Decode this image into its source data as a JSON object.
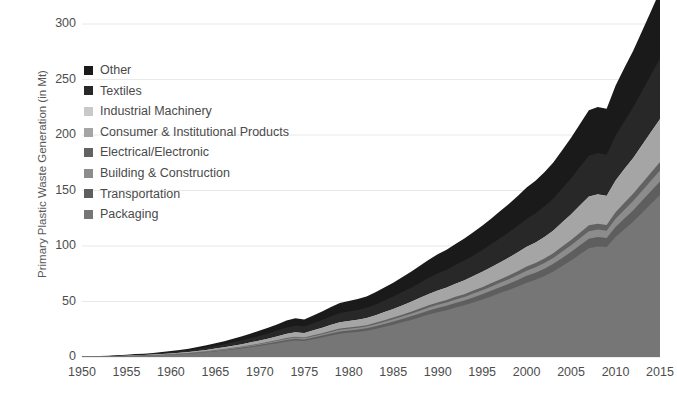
{
  "chart_data": {
    "type": "area",
    "stacked": true,
    "title": "",
    "xlabel": "",
    "ylabel": "Primary Plastic Waste Generation (in Mt)",
    "xlim": [
      1950,
      2015
    ],
    "ylim": [
      0,
      300
    ],
    "ytick_values": [
      0,
      50,
      100,
      150,
      200,
      250,
      300
    ],
    "ytick_labels": [
      "0",
      "50",
      "100",
      "150",
      "200",
      "250",
      "300"
    ],
    "xtick_values": [
      1950,
      1955,
      1960,
      1965,
      1970,
      1975,
      1980,
      1985,
      1990,
      1995,
      2000,
      2005,
      2010,
      2015
    ],
    "xtick_labels": [
      "1950",
      "1955",
      "1960",
      "1965",
      "1970",
      "1975",
      "1980",
      "1985",
      "1990",
      "1995",
      "2000",
      "2005",
      "2010",
      "2015"
    ],
    "grid": "horizontal",
    "legend_position": "upper-left-inside",
    "x": [
      1950,
      1951,
      1952,
      1953,
      1954,
      1955,
      1956,
      1957,
      1958,
      1959,
      1960,
      1961,
      1962,
      1963,
      1964,
      1965,
      1966,
      1967,
      1968,
      1969,
      1970,
      1971,
      1972,
      1973,
      1974,
      1975,
      1976,
      1977,
      1978,
      1979,
      1980,
      1981,
      1982,
      1983,
      1984,
      1985,
      1986,
      1987,
      1988,
      1989,
      1990,
      1991,
      1992,
      1993,
      1994,
      1995,
      1996,
      1997,
      1998,
      1999,
      2000,
      2001,
      2002,
      2003,
      2004,
      2005,
      2006,
      2007,
      2008,
      2009,
      2010,
      2011,
      2012,
      2013,
      2014,
      2015
    ],
    "series": [
      {
        "name": "Packaging",
        "color": "#767676",
        "values": [
          0.2,
          0.3,
          0.4,
          0.5,
          0.6,
          0.8,
          1.0,
          1.2,
          1.4,
          1.7,
          2.1,
          2.5,
          3.0,
          3.6,
          4.3,
          5.0,
          5.8,
          6.7,
          7.7,
          8.8,
          10.0,
          11.2,
          12.5,
          13.9,
          14.9,
          14.4,
          16.0,
          17.6,
          19.3,
          21.0,
          21.8,
          22.6,
          23.6,
          25.2,
          27.2,
          29.1,
          31.2,
          33.4,
          35.8,
          38.2,
          40.4,
          42.2,
          44.6,
          46.6,
          49.2,
          51.8,
          54.6,
          57.6,
          60.4,
          63.6,
          67.0,
          69.6,
          73.0,
          77.0,
          82.0,
          87.0,
          92.5,
          98.0,
          99.5,
          99.0,
          108.0,
          115.0,
          122.0,
          130.0,
          138.0,
          146.0
        ]
      },
      {
        "name": "Transportation",
        "color": "#5e5e5e",
        "values": [
          0.0,
          0.0,
          0.0,
          0.1,
          0.1,
          0.1,
          0.1,
          0.1,
          0.2,
          0.2,
          0.2,
          0.3,
          0.3,
          0.4,
          0.4,
          0.5,
          0.6,
          0.7,
          0.8,
          0.9,
          1.0,
          1.1,
          1.3,
          1.4,
          1.5,
          1.4,
          1.6,
          1.7,
          1.9,
          2.0,
          2.1,
          2.1,
          2.2,
          2.4,
          2.6,
          2.8,
          3.0,
          3.2,
          3.4,
          3.6,
          3.8,
          3.9,
          4.1,
          4.3,
          4.5,
          4.7,
          5.0,
          5.2,
          5.5,
          5.8,
          6.1,
          6.3,
          6.6,
          6.9,
          7.3,
          7.7,
          8.1,
          8.5,
          8.5,
          8.2,
          9.2,
          9.8,
          10.3,
          10.9,
          11.5,
          12.1
        ]
      },
      {
        "name": "Building & Construction",
        "color": "#8c8c8c",
        "values": [
          0.0,
          0.0,
          0.0,
          0.0,
          0.1,
          0.1,
          0.1,
          0.1,
          0.1,
          0.1,
          0.2,
          0.2,
          0.2,
          0.3,
          0.3,
          0.4,
          0.4,
          0.5,
          0.5,
          0.6,
          0.7,
          0.8,
          0.9,
          1.0,
          1.1,
          1.0,
          1.1,
          1.2,
          1.4,
          1.5,
          1.5,
          1.6,
          1.6,
          1.8,
          1.9,
          2.0,
          2.2,
          2.3,
          2.5,
          2.7,
          2.8,
          2.9,
          3.1,
          3.2,
          3.4,
          3.6,
          3.8,
          4.0,
          4.2,
          4.4,
          4.7,
          4.9,
          5.1,
          5.4,
          5.7,
          6.0,
          6.4,
          6.8,
          6.8,
          6.6,
          7.4,
          7.9,
          8.4,
          8.9,
          9.4,
          9.9
        ]
      },
      {
        "name": "Electrical/Electronic",
        "color": "#626262",
        "values": [
          0.0,
          0.0,
          0.0,
          0.0,
          0.0,
          0.0,
          0.1,
          0.1,
          0.1,
          0.1,
          0.1,
          0.1,
          0.2,
          0.2,
          0.2,
          0.3,
          0.3,
          0.4,
          0.4,
          0.5,
          0.5,
          0.6,
          0.7,
          0.8,
          0.8,
          0.8,
          0.9,
          1.0,
          1.1,
          1.2,
          1.2,
          1.2,
          1.3,
          1.4,
          1.5,
          1.6,
          1.7,
          1.8,
          2.0,
          2.1,
          2.2,
          2.3,
          2.4,
          2.5,
          2.7,
          2.8,
          3.0,
          3.1,
          3.3,
          3.5,
          3.7,
          3.8,
          4.0,
          4.2,
          4.5,
          4.7,
          5.0,
          5.3,
          5.3,
          5.1,
          5.8,
          6.2,
          6.5,
          6.9,
          7.3,
          7.7
        ]
      },
      {
        "name": "Consumer & Institutional Products",
        "color": "#a5a5a5",
        "values": [
          0.0,
          0.1,
          0.1,
          0.1,
          0.2,
          0.2,
          0.3,
          0.3,
          0.4,
          0.5,
          0.6,
          0.7,
          0.8,
          1.0,
          1.2,
          1.4,
          1.6,
          1.8,
          2.1,
          2.4,
          2.7,
          3.0,
          3.4,
          3.7,
          4.0,
          3.9,
          4.3,
          4.7,
          5.2,
          5.6,
          5.8,
          6.0,
          6.3,
          6.7,
          7.2,
          7.7,
          8.3,
          8.9,
          9.5,
          10.1,
          10.7,
          11.2,
          11.8,
          12.4,
          13.0,
          13.7,
          14.4,
          15.2,
          16.0,
          16.8,
          17.7,
          18.4,
          19.3,
          20.3,
          21.6,
          22.9,
          24.4,
          25.8,
          26.2,
          26.1,
          28.4,
          30.3,
          32.1,
          34.2,
          36.3,
          38.4
        ]
      },
      {
        "name": "Industrial Machinery",
        "color": "#c9c9c9",
        "values": [
          0.0,
          0.0,
          0.0,
          0.0,
          0.0,
          0.0,
          0.0,
          0.0,
          0.0,
          0.0,
          0.0,
          0.0,
          0.0,
          0.0,
          0.0,
          0.0,
          0.0,
          0.0,
          0.0,
          0.0,
          0.0,
          0.0,
          0.0,
          0.1,
          0.1,
          0.1,
          0.1,
          0.1,
          0.1,
          0.1,
          0.1,
          0.1,
          0.1,
          0.1,
          0.1,
          0.1,
          0.1,
          0.1,
          0.1,
          0.1,
          0.1,
          0.1,
          0.1,
          0.1,
          0.1,
          0.1,
          0.1,
          0.1,
          0.2,
          0.2,
          0.2,
          0.2,
          0.2,
          0.2,
          0.2,
          0.2,
          0.3,
          0.3,
          0.3,
          0.3,
          0.3,
          0.3,
          0.3,
          0.4,
          0.4,
          0.4
        ]
      },
      {
        "name": "Textiles",
        "color": "#282828",
        "values": [
          0.1,
          0.1,
          0.2,
          0.2,
          0.3,
          0.4,
          0.5,
          0.6,
          0.7,
          0.9,
          1.1,
          1.3,
          1.5,
          1.8,
          2.1,
          2.4,
          2.7,
          3.1,
          3.5,
          3.9,
          4.3,
          4.7,
          5.2,
          5.7,
          6.0,
          5.8,
          6.4,
          7.0,
          7.6,
          8.2,
          8.5,
          8.8,
          9.2,
          9.8,
          10.5,
          11.2,
          12.0,
          12.8,
          13.7,
          14.6,
          15.4,
          16.1,
          16.9,
          17.8,
          18.6,
          19.6,
          20.6,
          21.7,
          22.8,
          24.0,
          25.2,
          26.2,
          27.5,
          28.9,
          30.7,
          32.6,
          34.6,
          36.6,
          37.2,
          37.0,
          40.3,
          43.0,
          45.6,
          48.5,
          51.5,
          54.5
        ]
      },
      {
        "name": "Other",
        "color": "#1a1a1a",
        "values": [
          0.1,
          0.1,
          0.2,
          0.2,
          0.3,
          0.4,
          0.5,
          0.6,
          0.7,
          0.9,
          1.1,
          1.3,
          1.5,
          1.8,
          2.1,
          2.4,
          2.8,
          3.2,
          3.6,
          4.1,
          4.6,
          5.1,
          5.6,
          6.2,
          6.6,
          6.4,
          7.0,
          7.7,
          8.4,
          9.1,
          9.4,
          9.8,
          10.2,
          10.9,
          11.7,
          12.5,
          13.4,
          14.3,
          15.3,
          16.3,
          17.2,
          18.0,
          18.9,
          19.8,
          20.8,
          21.9,
          23.1,
          24.3,
          25.5,
          26.8,
          28.2,
          29.3,
          30.7,
          32.3,
          34.3,
          36.4,
          38.6,
          40.9,
          41.5,
          41.3,
          45.0,
          48.0,
          50.9,
          54.1,
          57.4,
          60.8
        ]
      }
    ],
    "legend_order_top_to_bottom": [
      "Other",
      "Textiles",
      "Industrial Machinery",
      "Consumer & Institutional Products",
      "Electrical/Electronic",
      "Building & Construction",
      "Transportation",
      "Packaging"
    ]
  },
  "axes": {
    "y_axis_title": "Primary Plastic Waste Generation (in Mt)"
  },
  "legend": {
    "items": [
      {
        "label": "Other",
        "color": "#1a1a1a"
      },
      {
        "label": "Textiles",
        "color": "#282828"
      },
      {
        "label": "Industrial Machinery",
        "color": "#c9c9c9"
      },
      {
        "label": "Consumer & Institutional Products",
        "color": "#a5a5a5"
      },
      {
        "label": "Electrical/Electronic",
        "color": "#626262"
      },
      {
        "label": "Building & Construction",
        "color": "#8c8c8c"
      },
      {
        "label": "Transportation",
        "color": "#5e5e5e"
      },
      {
        "label": "Packaging",
        "color": "#767676"
      }
    ]
  },
  "style": {
    "gridline_color": "#e8e8e8",
    "axis_line_color": "#d9d9d9",
    "tick_text_color": "#4d4d4d",
    "background": "#ffffff"
  }
}
